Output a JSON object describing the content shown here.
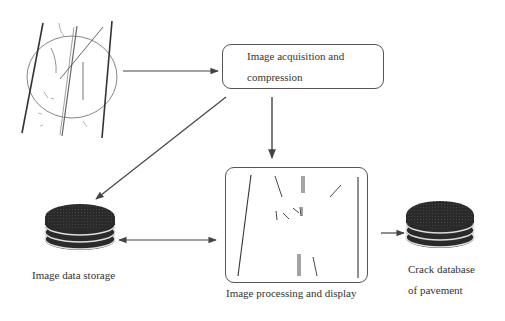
{
  "diagram": {
    "nodes": {
      "acquisition": {
        "label_line1": "Image acquisition and",
        "label_line2": "compression"
      },
      "processing": {
        "label": "Image processing and display"
      },
      "storage": {
        "label": "Image data storage",
        "icon": "database-icon"
      },
      "crack_db": {
        "label_line1": "Crack database",
        "label_line2": "of  pavement",
        "icon": "database-icon"
      },
      "road_image": {
        "icon": "pavement-crack-image"
      }
    },
    "edges": [
      {
        "from": "road_image",
        "to": "acquisition",
        "type": "arrow"
      },
      {
        "from": "acquisition",
        "to": "processing",
        "type": "arrow"
      },
      {
        "from": "acquisition",
        "to": "storage",
        "type": "arrow"
      },
      {
        "from": "storage",
        "to": "processing",
        "type": "bidirectional"
      },
      {
        "from": "processing",
        "to": "crack_db",
        "type": "arrow"
      }
    ],
    "colors": {
      "line": "#444444",
      "disk": "#2a2a2a",
      "background": "#ffffff"
    }
  }
}
